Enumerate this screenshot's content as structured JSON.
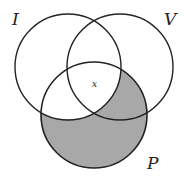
{
  "diagram": {
    "type": "venn-3",
    "sets": [
      {
        "label": "I",
        "cx": 68,
        "cy": 67,
        "r": 53,
        "label_x": 14,
        "label_y": 24
      },
      {
        "label": "V",
        "cx": 120,
        "cy": 67,
        "r": 53,
        "label_x": 166,
        "label_y": 24
      },
      {
        "label": "P",
        "cx": 94,
        "cy": 115,
        "r": 53,
        "label_x": 148,
        "label_y": 168
      }
    ],
    "shaded_region": "P minus I",
    "shade_color": "#a8a8a8",
    "stroke_color": "#222222",
    "center_label": "x",
    "center_label_x": 94,
    "center_label_y": 86
  }
}
